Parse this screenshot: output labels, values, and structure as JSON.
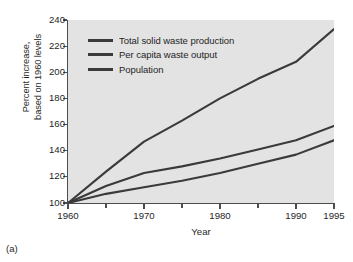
{
  "figure": {
    "caption": "(a)"
  },
  "chart_data": {
    "type": "line",
    "title": "",
    "xlabel": "Year",
    "ylabel": "Percent increase, based on 1960 levels",
    "ylabel_lines": [
      "Percent increase,",
      "based on 1960 levels"
    ],
    "xlim": [
      1960,
      1995
    ],
    "ylim": [
      100,
      240
    ],
    "grid": false,
    "legend_position": "upper-left-inside",
    "x_major_ticks": [
      1960,
      1970,
      1980,
      1990,
      1995
    ],
    "x_minor_ticks": [
      1965,
      1975,
      1985
    ],
    "x_tick_labels": [
      "1960",
      "1970",
      "1980",
      "1990",
      "1995"
    ],
    "y_ticks": [
      100,
      120,
      140,
      160,
      180,
      200,
      220,
      240
    ],
    "y_tick_labels": [
      "100",
      "120",
      "140",
      "160",
      "180",
      "200",
      "220",
      "240"
    ],
    "plot_background": "#e3e3e3",
    "line_color": "#3a3a3a",
    "series": [
      {
        "name": "Total solid waste production",
        "color": "#3a3a3a",
        "x": [
          1960,
          1965,
          1970,
          1975,
          1980,
          1985,
          1990,
          1995
        ],
        "values": [
          100,
          124,
          147,
          163,
          180,
          195,
          208,
          233
        ]
      },
      {
        "name": "Per capita waste output",
        "color": "#3a3a3a",
        "x": [
          1960,
          1965,
          1970,
          1975,
          1980,
          1985,
          1990,
          1995
        ],
        "values": [
          100,
          113,
          123,
          128,
          134,
          141,
          148,
          159
        ]
      },
      {
        "name": "Population",
        "color": "#3a3a3a",
        "x": [
          1960,
          1965,
          1970,
          1975,
          1980,
          1985,
          1990,
          1995
        ],
        "values": [
          100,
          107,
          112,
          117,
          123,
          130,
          137,
          148
        ]
      }
    ]
  }
}
